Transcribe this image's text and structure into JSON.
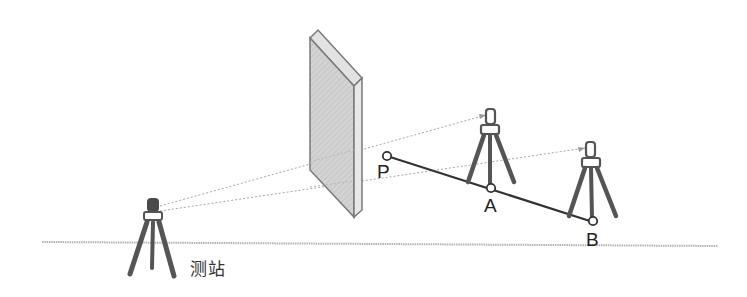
{
  "diagram": {
    "type": "surveying-setup",
    "labels": {
      "station": "测站",
      "point_p": "P",
      "point_a": "A",
      "point_b": "B"
    },
    "colors": {
      "ground_line": "#b0b0b0",
      "sight_line": "#aaaaaa",
      "baseline": "#333333",
      "tripod": "#555555",
      "wall_face": "#cfcfcf",
      "wall_edge": "#777777"
    },
    "elements": [
      {
        "id": "station",
        "kind": "tripod-instrument",
        "label": "测站"
      },
      {
        "id": "obstacle",
        "kind": "wall"
      },
      {
        "id": "target-a",
        "kind": "tripod-prism",
        "point": "A"
      },
      {
        "id": "target-b",
        "kind": "tripod-prism",
        "point": "B"
      },
      {
        "id": "line-pb",
        "kind": "line",
        "from": "P",
        "to": "B",
        "through": "A"
      }
    ]
  }
}
